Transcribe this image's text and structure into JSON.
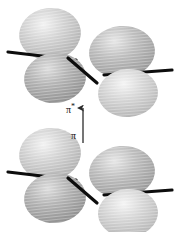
{
  "figure": {
    "background_color": "#ffffff",
    "width": 176,
    "height": 232
  },
  "labels": {
    "pi_star": {
      "text": "π",
      "superscript": "*",
      "x": 66,
      "y": 103,
      "color": "#111111"
    },
    "pi": {
      "text": "π",
      "x": 71,
      "y": 131,
      "color": "#111111"
    }
  },
  "transition_arrow": {
    "name": "pi-to-pi-star-transition",
    "direction": "up",
    "x": 83,
    "y_top": 106,
    "y_bottom": 143,
    "color": "#2b2b2b"
  },
  "orbital_units": [
    {
      "name": "upper-orbital-unit",
      "role": "antibonding-pi-star-orbital",
      "center_y": 58,
      "lobes": [
        {
          "name": "upper-left-top-lobe",
          "cx": 50,
          "cy": 34,
          "rx": 31,
          "ry": 26,
          "fill": "#c9c9c9",
          "tilt": -8
        },
        {
          "name": "upper-left-bottom-lobe",
          "cx": 55,
          "cy": 78,
          "rx": 31,
          "ry": 25,
          "fill": "#a8a8a8",
          "tilt": -6
        },
        {
          "name": "upper-right-top-lobe",
          "cx": 122,
          "cy": 52,
          "rx": 33,
          "ry": 26,
          "fill": "#b3b3b3",
          "tilt": -5
        },
        {
          "name": "upper-right-bottom-lobe",
          "cx": 128,
          "cy": 93,
          "rx": 30,
          "ry": 24,
          "fill": "#c4c4c4",
          "tilt": -4
        }
      ],
      "bonds": [
        {
          "name": "upper-left-bond-axis",
          "x1": 8,
          "y1": 52,
          "x2": 76,
          "y2": 60
        },
        {
          "name": "upper-right-bond-axis",
          "x1": 104,
          "y1": 75,
          "x2": 172,
          "y2": 70
        },
        {
          "name": "upper-center-bond",
          "x1": 68,
          "y1": 58,
          "x2": 97,
          "y2": 83
        }
      ]
    },
    {
      "name": "lower-orbital-unit",
      "role": "bonding-pi-orbital",
      "center_y": 178,
      "lobes": [
        {
          "name": "lower-left-top-lobe",
          "cx": 50,
          "cy": 154,
          "rx": 31,
          "ry": 26,
          "fill": "#c9c9c9",
          "tilt": -8
        },
        {
          "name": "lower-left-bottom-lobe",
          "cx": 55,
          "cy": 198,
          "rx": 31,
          "ry": 25,
          "fill": "#a8a8a8",
          "tilt": -6
        },
        {
          "name": "lower-right-top-lobe",
          "cx": 122,
          "cy": 172,
          "rx": 33,
          "ry": 26,
          "fill": "#b3b3b3",
          "tilt": -5
        },
        {
          "name": "lower-right-bottom-lobe",
          "cx": 128,
          "cy": 213,
          "rx": 30,
          "ry": 24,
          "fill": "#c4c4c4",
          "tilt": -4
        }
      ],
      "bonds": [
        {
          "name": "lower-left-bond-axis",
          "x1": 8,
          "y1": 172,
          "x2": 76,
          "y2": 180
        },
        {
          "name": "lower-right-bond-axis",
          "x1": 104,
          "y1": 195,
          "x2": 172,
          "y2": 190
        },
        {
          "name": "lower-center-bond",
          "x1": 68,
          "y1": 178,
          "x2": 97,
          "y2": 203
        }
      ]
    }
  ],
  "colors": {
    "lobe_light": "#c9c9c9",
    "lobe_mid": "#b3b3b3",
    "lobe_dark": "#a8a8a8",
    "lobe_pale": "#c4c4c4",
    "bond_line": "#0d0d0d",
    "arrow": "#2b2b2b",
    "text": "#111111",
    "background": "#ffffff"
  }
}
